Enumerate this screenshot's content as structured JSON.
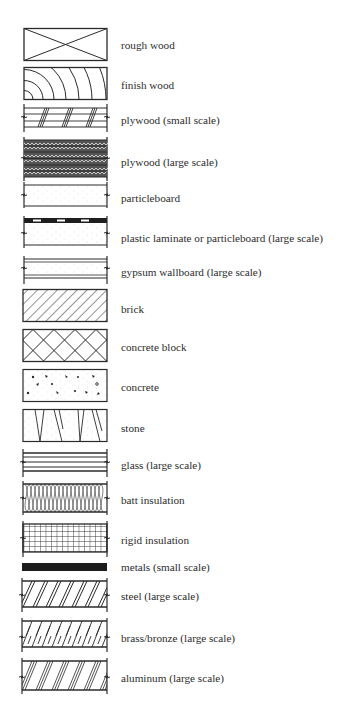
{
  "legend": {
    "title": "Material section symbols",
    "items": [
      {
        "id": "rough-wood",
        "label": "rough wood"
      },
      {
        "id": "finish-wood",
        "label": "finish wood"
      },
      {
        "id": "plywood-small",
        "label": "plywood (small scale)"
      },
      {
        "id": "plywood-large",
        "label": "plywood (large scale)"
      },
      {
        "id": "particleboard",
        "label": "particleboard"
      },
      {
        "id": "plastic-laminate",
        "label": "plastic laminate or particleboard (large scale)"
      },
      {
        "id": "gypsum-wallboard",
        "label": "gypsum wallboard (large scale)"
      },
      {
        "id": "brick",
        "label": "brick"
      },
      {
        "id": "concrete-block",
        "label": "concrete block"
      },
      {
        "id": "concrete",
        "label": "concrete"
      },
      {
        "id": "stone",
        "label": "stone"
      },
      {
        "id": "glass",
        "label": "glass (large scale)"
      },
      {
        "id": "batt-insulation",
        "label": "batt insulation"
      },
      {
        "id": "rigid-insulation",
        "label": "rigid insulation"
      },
      {
        "id": "metals-small",
        "label": "metals (small scale)"
      },
      {
        "id": "steel-large",
        "label": "steel (large scale)"
      },
      {
        "id": "brass-bronze-large",
        "label": "brass/bronze (large scale)"
      },
      {
        "id": "aluminum-large",
        "label": "aluminum (large scale)"
      }
    ]
  },
  "colors": {
    "ink": "#2a2a2a",
    "background": "#ffffff"
  }
}
